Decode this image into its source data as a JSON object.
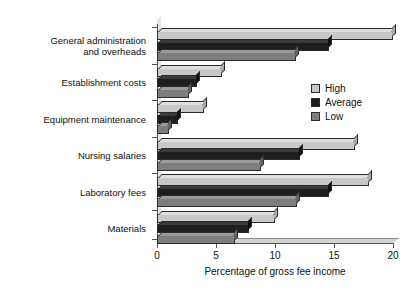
{
  "chart_data": {
    "type": "bar",
    "orientation": "horizontal",
    "title": "",
    "xlabel": "Percentage of gross fee income",
    "ylabel": "",
    "xlim": [
      0,
      20
    ],
    "xticks": [
      0,
      5,
      10,
      15,
      20
    ],
    "xtick_labels": [
      "0",
      "5",
      "10",
      "15",
      "20"
    ],
    "grid": false,
    "legend_position": "right-upper",
    "categories": [
      "General administration\nand overheads",
      "Establishment costs",
      "Equipment maintenance",
      "Nursing salaries",
      "Laboratory fees",
      "Materials"
    ],
    "series": [
      {
        "name": "High",
        "color": "#c8c8c8",
        "values": [
          20.0,
          5.5,
          4.0,
          16.8,
          18.0,
          10.0
        ]
      },
      {
        "name": "Average",
        "color": "#1e1e1e",
        "values": [
          14.6,
          3.4,
          1.8,
          12.1,
          14.6,
          7.8
        ]
      },
      {
        "name": "Low",
        "color": "#7d7d7d",
        "values": [
          11.8,
          2.7,
          1.0,
          8.8,
          11.9,
          6.6
        ]
      }
    ]
  }
}
